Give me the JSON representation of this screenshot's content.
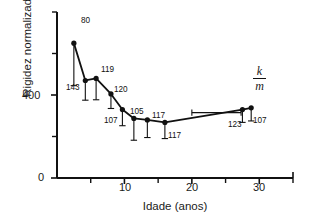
{
  "figure": {
    "background_color": "#ffffff",
    "line_color": "#111111",
    "marker_color": "#111111"
  },
  "annotation": {
    "numerator": "k",
    "denominator": "m"
  },
  "axes": {
    "y_label_text": "Rigidez normalizada (S",
    "y_label_sup": "-2",
    "y_label_close": ")",
    "x_label": "Idade (anos)",
    "y_ticklabels": [
      "0",
      "400"
    ],
    "x_ticklabels": [
      "10",
      "20",
      "30"
    ]
  },
  "chart_data": {
    "type": "line",
    "title": "",
    "xlabel": "Idade (anos)",
    "ylabel": "Rigidez normalizada (S^-2)",
    "xlim": [
      0,
      35
    ],
    "ylim": [
      0,
      800
    ],
    "grid": false,
    "legend": null,
    "x_major_ticks": [
      0,
      10,
      20,
      30
    ],
    "x_minor_ticks": [
      5,
      15,
      25,
      35
    ],
    "y_major_ticks": [
      0,
      400
    ],
    "y_minor_ticks": [
      200,
      600,
      800
    ],
    "annotations": [
      {
        "text": "k/m",
        "x": 29.5,
        "y": 560,
        "style": "italic-fraction"
      }
    ],
    "series": [
      {
        "name": "Rigidez normalizada",
        "x": [
          2.5,
          4.2,
          5.8,
          8.0,
          9.7,
          11.4,
          13.4,
          16.0,
          27.5,
          28.8
        ],
        "y": [
          650,
          470,
          480,
          405,
          330,
          287,
          280,
          268,
          330,
          338
        ],
        "y_err_low": [
          205,
          95,
          103,
          70,
          78,
          105,
          85,
          78,
          62,
          63
        ],
        "y_err_high": [
          0,
          0,
          0,
          0,
          0,
          0,
          0,
          0,
          0,
          0
        ],
        "n_labels": [
          "80",
          "143",
          "119",
          "120",
          "107",
          "105",
          "117",
          "117",
          "123",
          "107"
        ]
      }
    ],
    "extra_marks": [
      {
        "type": "horizontal-error-bar",
        "y": 315,
        "x_start": 20.0,
        "x_end": 27.3
      }
    ],
    "fit_line": {
      "x": [
        2.5,
        4.2,
        5.8,
        8.0,
        9.7,
        11.4,
        13.4,
        16.0,
        27.5,
        28.8
      ],
      "y": [
        650,
        470,
        480,
        405,
        330,
        287,
        280,
        268,
        330,
        338
      ]
    }
  }
}
